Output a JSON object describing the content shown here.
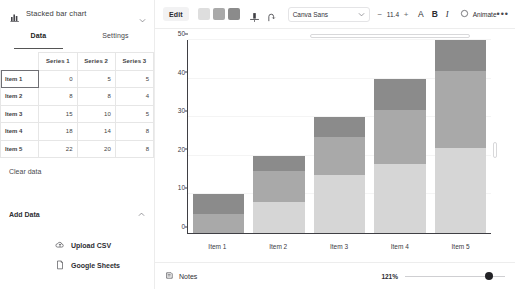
{
  "left_panel": {
    "chart_type": "Stacked bar chart",
    "chart_type_icon": "bar-chart-icon",
    "caret_icon": "chevron-down-icon",
    "tabs": [
      {
        "label": "Data",
        "active": true
      },
      {
        "label": "Settings",
        "active": false
      }
    ],
    "table": {
      "corner": "",
      "headers": [
        "Series 1",
        "Series 2",
        "Series 3"
      ],
      "rows": [
        {
          "name": "Item 1",
          "values": [
            0,
            5,
            5
          ]
        },
        {
          "name": "Item 2",
          "values": [
            8,
            8,
            4
          ]
        },
        {
          "name": "Item 3",
          "values": [
            15,
            10,
            5
          ]
        },
        {
          "name": "Item 4",
          "values": [
            18,
            14,
            8
          ]
        },
        {
          "name": "Item 5",
          "values": [
            22,
            20,
            8
          ]
        }
      ]
    },
    "clear_data": "Clear data",
    "add_data": "Add Data",
    "add_data_chevron_icon": "chevron-up-icon",
    "sources": [
      {
        "label": "Upload CSV",
        "icon": "cloud-upload-icon"
      },
      {
        "label": "Google Sheets",
        "icon": "document-icon"
      }
    ]
  },
  "toolbar": {
    "edit_label": "Edit",
    "swatches": [
      "#dedede",
      "#a9a9a9",
      "#8b8b8b"
    ],
    "position_icon": "position-align-icon",
    "curve_icon": "curve-text-icon",
    "font_name": "Canva Sans",
    "font_caret_icon": "chevron-down-icon",
    "size_decrease": "−",
    "font_size": "11.4",
    "size_increase": "+",
    "text_color_label": "A",
    "bold_label": "B",
    "italic_label": "I",
    "animate_label": "Animate",
    "animate_icon": "animate-circle-icon",
    "more_label": "•••"
  },
  "canvas": {
    "rotate_icon": "rotate-handle-icon"
  },
  "bottom_bar": {
    "notes_label": "Notes",
    "notes_icon": "notes-icon",
    "zoom_level": "121%"
  },
  "chart_data": {
    "type": "bar",
    "subtype": "stacked-bar",
    "title": "",
    "xlabel": "",
    "ylabel": "",
    "categories": [
      "Item 1",
      "Item 2",
      "Item 3",
      "Item 4",
      "Item 5"
    ],
    "series": [
      {
        "name": "Series 1",
        "values": [
          0,
          8,
          15,
          18,
          22
        ],
        "color": "#d6d6d6"
      },
      {
        "name": "Series 2",
        "values": [
          5,
          8,
          10,
          14,
          20
        ],
        "color": "#a9a9a9"
      },
      {
        "name": "Series 3",
        "values": [
          5,
          4,
          5,
          8,
          8
        ],
        "color": "#8b8b8b"
      }
    ],
    "totals": [
      10,
      20,
      30,
      40,
      50
    ],
    "ylim": [
      0,
      50
    ],
    "yticks": [
      0,
      10,
      20,
      30,
      40,
      50
    ],
    "grid": true,
    "legend": "none"
  }
}
